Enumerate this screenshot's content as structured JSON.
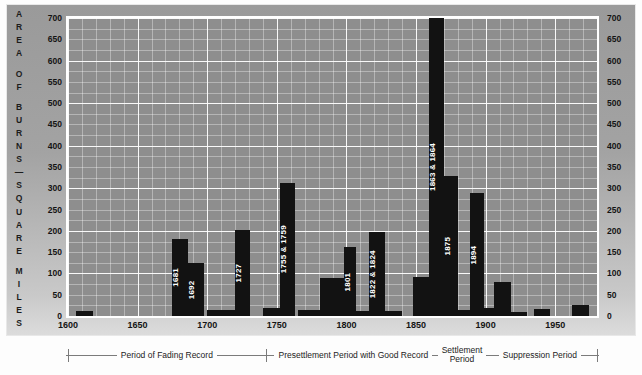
{
  "axes": {
    "y_caption_letters": [
      "A",
      "R",
      "E",
      "A",
      "",
      "O",
      "F",
      "",
      "B",
      "U",
      "R",
      "N",
      "S",
      "—",
      "S",
      "Q",
      "U",
      "A",
      "R",
      "E",
      "",
      "M",
      "I",
      "L",
      "E",
      "S"
    ],
    "y_caption_text": "AREA OF BURNS — SQUARE MILES",
    "y_ticks": [
      0,
      50,
      100,
      150,
      200,
      250,
      300,
      350,
      400,
      450,
      500,
      550,
      600,
      650,
      700
    ],
    "x_ticks": [
      1600,
      1650,
      1700,
      1750,
      1800,
      1850,
      1900,
      1950
    ],
    "xlim": [
      1600,
      1980
    ],
    "ylim": [
      0,
      700
    ]
  },
  "periods": [
    {
      "label": "Period of Fading Record",
      "start": 1600,
      "end": 1742
    },
    {
      "label": "Presettlement Period with Good Record",
      "start": 1742,
      "end": 1868
    },
    {
      "label": "Settlement\nPeriod",
      "start": 1868,
      "end": 1898
    },
    {
      "label": "Suppression Period",
      "start": 1898,
      "end": 1980
    }
  ],
  "colors": {
    "bar": "#121212",
    "plot_background": "#8e8e8e",
    "gridline": "#ffffff",
    "panel": "#a3a3a3",
    "page": "#fdfdfd",
    "axis_text": "#141414",
    "bar_label_text": "#ffffff"
  },
  "chart_data": {
    "type": "bar",
    "title": "",
    "xlabel": "",
    "ylabel": "AREA OF BURNS — SQUARE MILES",
    "xlim": [
      1600,
      1980
    ],
    "ylim": [
      0,
      700
    ],
    "grid": true,
    "legend": "none",
    "categories": [
      1610,
      1681,
      1692,
      1705,
      1727,
      1745,
      1755,
      1768,
      1782,
      1801,
      1812,
      1822,
      1840,
      1855,
      1863,
      1875,
      1885,
      1894,
      1905,
      1915,
      1925,
      1940,
      1968
    ],
    "bars": [
      {
        "start": 1606,
        "end": 1618,
        "value": 12,
        "label": ""
      },
      {
        "start": 1675,
        "end": 1686,
        "value": 180,
        "label": "1681"
      },
      {
        "start": 1686,
        "end": 1698,
        "value": 125,
        "label": "1692"
      },
      {
        "start": 1700,
        "end": 1720,
        "value": 15,
        "label": ""
      },
      {
        "start": 1720,
        "end": 1731,
        "value": 203,
        "label": "1727"
      },
      {
        "start": 1740,
        "end": 1752,
        "value": 18,
        "label": ""
      },
      {
        "start": 1752,
        "end": 1763,
        "value": 313,
        "label": "1755 & 1759"
      },
      {
        "start": 1765,
        "end": 1781,
        "value": 13,
        "label": ""
      },
      {
        "start": 1781,
        "end": 1798,
        "value": 90,
        "label": ""
      },
      {
        "start": 1798,
        "end": 1807,
        "value": 163,
        "label": "1801"
      },
      {
        "start": 1807,
        "end": 1816,
        "value": 12,
        "label": ""
      },
      {
        "start": 1816,
        "end": 1828,
        "value": 198,
        "label": "1822 & 1824"
      },
      {
        "start": 1828,
        "end": 1840,
        "value": 12,
        "label": ""
      },
      {
        "start": 1848,
        "end": 1859,
        "value": 92,
        "label": ""
      },
      {
        "start": 1859,
        "end": 1870,
        "value": 700,
        "label": "1863 & 1864"
      },
      {
        "start": 1870,
        "end": 1880,
        "value": 330,
        "label": "1875"
      },
      {
        "start": 1880,
        "end": 1889,
        "value": 14,
        "label": ""
      },
      {
        "start": 1889,
        "end": 1899,
        "value": 290,
        "label": "1894"
      },
      {
        "start": 1899,
        "end": 1906,
        "value": 18,
        "label": ""
      },
      {
        "start": 1906,
        "end": 1918,
        "value": 80,
        "label": ""
      },
      {
        "start": 1918,
        "end": 1930,
        "value": 10,
        "label": ""
      },
      {
        "start": 1935,
        "end": 1946,
        "value": 16,
        "label": ""
      },
      {
        "start": 1962,
        "end": 1974,
        "value": 26,
        "label": ""
      }
    ]
  }
}
